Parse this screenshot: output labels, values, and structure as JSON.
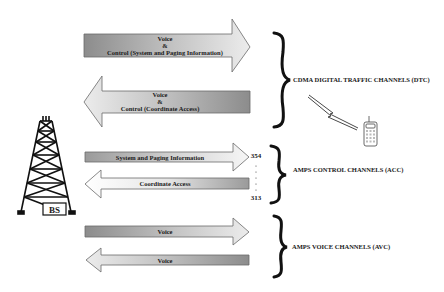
{
  "diagram": {
    "base_station": {
      "label": "BS"
    },
    "groups": [
      {
        "label": "CDMA DIGITAL TRAFFIC CHANNELS (DTC)",
        "arrows": [
          {
            "direction": "forward",
            "lines": [
              "Voice",
              "&",
              "Control (System and Paging Information)"
            ]
          },
          {
            "direction": "reverse",
            "lines": [
              "Voice",
              "&",
              "Control (Coordinate Access)"
            ]
          }
        ]
      },
      {
        "label": "AMPS CONTROL CHANNELS (ACC)",
        "arrows": [
          {
            "direction": "forward",
            "lines": [
              "System and Paging Information"
            ]
          },
          {
            "direction": "reverse",
            "lines": [
              "Coordinate Access"
            ]
          }
        ],
        "channel_range": {
          "top": "354",
          "bottom": "313"
        }
      },
      {
        "label": "AMPS VOICE CHANNELS (AVC)",
        "arrows": [
          {
            "direction": "forward",
            "lines": [
              "Voice"
            ]
          },
          {
            "direction": "reverse",
            "lines": [
              "Voice"
            ]
          }
        ]
      }
    ],
    "colors": {
      "arrow_dark": "#8a8a8a",
      "arrow_light": "#f2f2f2",
      "stroke": "#5a5a5a",
      "text": "#1a1a1a"
    }
  }
}
